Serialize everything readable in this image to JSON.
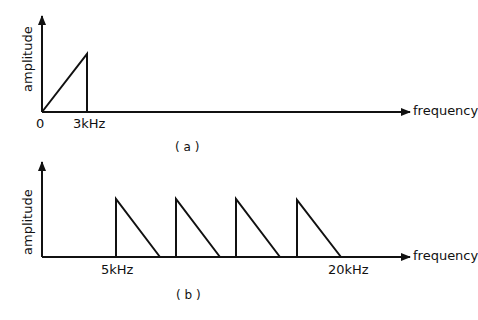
{
  "panel_a": {
    "caption": "( a )",
    "ylabel": "amplitude",
    "xlabel": "frequency",
    "ticks": [
      "0",
      "3kHz"
    ]
  },
  "panel_b": {
    "caption": "( b )",
    "ylabel": "amplitude",
    "xlabel": "frequency",
    "ticks": [
      "5kHz",
      "20kHz"
    ]
  },
  "colors": {
    "ink": "#111111",
    "background": "#ffffff"
  }
}
